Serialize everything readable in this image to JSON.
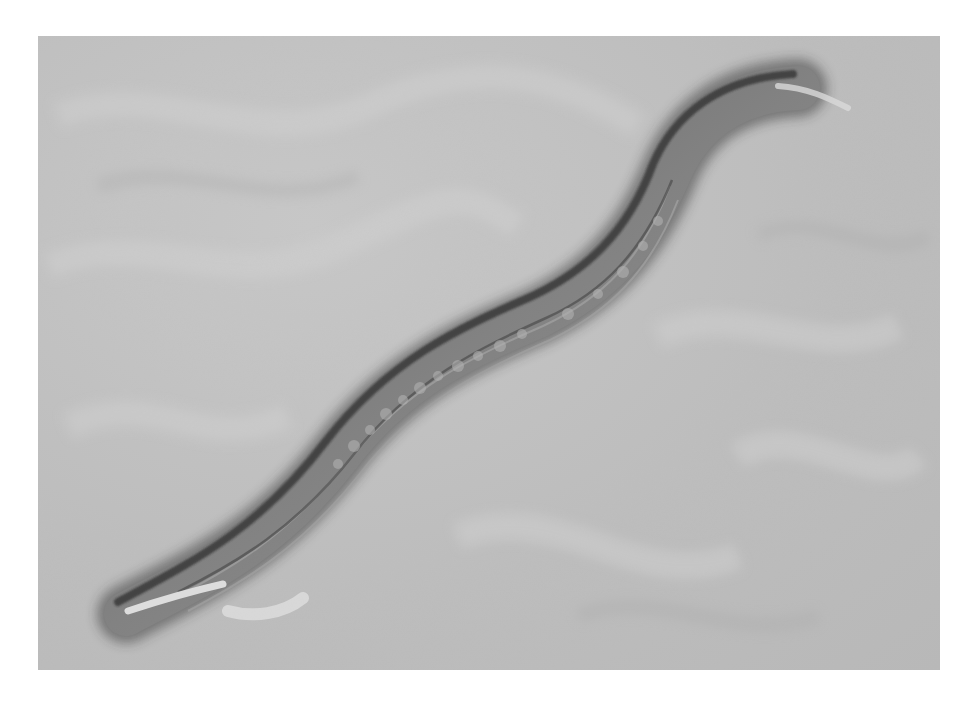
{
  "image": {
    "description": "Brightfield DIC micrograph of a nematode worm lying diagonally on a grey textured background",
    "subject": "nematode",
    "colors": {
      "background": "#ffffff",
      "field": "#bebebe",
      "worm_body": "#6e6e6e",
      "worm_edge_shadow": "#2a2a2a",
      "worm_highlight": "#dcdcdc"
    }
  }
}
